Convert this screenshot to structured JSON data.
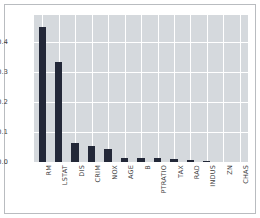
{
  "chart_data": {
    "type": "bar",
    "title": "",
    "subtitle": "",
    "xlabel": "",
    "ylabel": "",
    "categories": [
      "RM",
      "LSTAT",
      "DIS",
      "CRIM",
      "NOX",
      "AGE",
      "B",
      "PTRATIO",
      "TAX",
      "RAD",
      "INDUS",
      "ZN",
      "CHAS"
    ],
    "values": [
      0.45,
      0.335,
      0.065,
      0.055,
      0.042,
      0.013,
      0.012,
      0.012,
      0.01,
      0.006,
      0.005,
      0.001,
      0.0
    ],
    "series": [
      {
        "name": "feature importance",
        "values": [
          0.45,
          0.335,
          0.065,
          0.055,
          0.042,
          0.013,
          0.012,
          0.012,
          0.01,
          0.006,
          0.005,
          0.001,
          0.0
        ]
      }
    ],
    "ylim": [
      0.0,
      0.49
    ],
    "xlim": [
      0,
      13
    ],
    "yticks": [
      0.0,
      0.1,
      0.2,
      0.3,
      0.4
    ],
    "ytick_labels": [
      "0.0",
      "0.1",
      "0.2",
      "0.3",
      "0.4"
    ],
    "grid": true,
    "grid_color": "#ffffff",
    "legend": "none",
    "bar_color": "#232838",
    "plot_background": "#d5d9dd",
    "figure_background": "#ffffff",
    "frame_color": "#b9bcc0",
    "tick_label_color": "#3c3c3c",
    "xtick_rotation": 90
  }
}
